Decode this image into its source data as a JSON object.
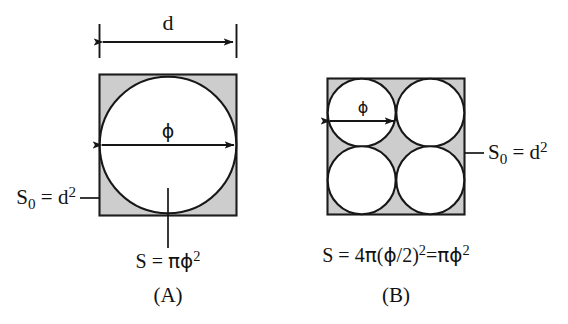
{
  "figure": {
    "type": "geometry-diagram",
    "background_color": "#ffffff",
    "fill_color": "#cdcdcd",
    "stroke_color": "#161616",
    "dimension": {
      "label": "d",
      "name": "square-side-dimension"
    },
    "panels": [
      {
        "id": "A",
        "caption": "(A)",
        "circle_count": 1,
        "diameter_label": "ϕ",
        "square_area_label": {
          "base": "S",
          "subscript": "0",
          "equals": " = d",
          "superscript": "2"
        },
        "circle_area_label": {
          "prefix": "S = ",
          "pi": "π",
          "phi": "ϕ",
          "superscript": "2"
        },
        "square_area_text": "S0 = d2",
        "circle_area_text": "S = πϕ2"
      },
      {
        "id": "B",
        "caption": "(B)",
        "circle_count": 4,
        "diameter_label": "ϕ",
        "square_area_label": {
          "base": "S",
          "subscript": "0",
          "equals": " = d",
          "superscript": "2"
        },
        "circle_area_label": {
          "prefix": "S = 4",
          "pi": "π",
          "open": "(",
          "phi": "ϕ",
          "half": "/2",
          "close": ")",
          "superscript": "2",
          "equals": "=",
          "pi2": "π",
          "phi2": "ϕ",
          "superscript2": "2"
        },
        "square_area_text": "S0 = d2",
        "circle_area_text": "S = 4π(ϕ/2)2=πϕ2"
      }
    ]
  }
}
